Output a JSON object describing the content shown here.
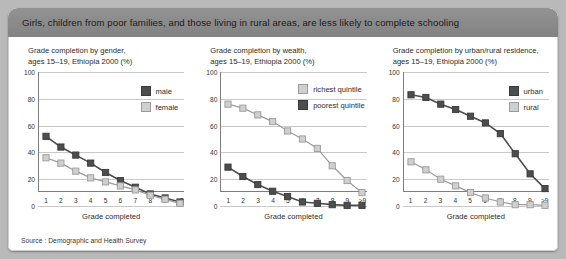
{
  "banner": {
    "headline": "Girls, children from poor families, and those living in rural areas, are less likely to complete schooling"
  },
  "source": {
    "text": "Source : Demographic and Health Survey"
  },
  "axis": {
    "ylabel_ticks": [
      "0",
      "20",
      "40",
      "60",
      "80",
      "100"
    ],
    "xlabel": "Grade completed",
    "xticks": [
      "1",
      "2",
      "3",
      "4",
      "5",
      "6",
      "7",
      "8",
      "9",
      ">9"
    ]
  },
  "colors": {
    "dark": "#4d4d4d",
    "dark_border": "#3a3a3a",
    "light": "#cfcfcf",
    "light_border": "#9b9b9b",
    "grid": "#c9c9c9",
    "axis": "#7d7d7d",
    "banner": "#8a8a8a",
    "page": "#b9b9b9"
  },
  "chart_data": [
    {
      "type": "line",
      "id": "gender",
      "title": "Grade completion by gender,\nages 15–19, Ethiopia 2000 (%)",
      "xlabel": "Grade completed",
      "ylabel": "",
      "categories": [
        "1",
        "2",
        "3",
        "4",
        "5",
        "6",
        "7",
        "8",
        "9",
        ">9"
      ],
      "ylim": [
        0,
        100
      ],
      "yticks": [
        0,
        20,
        40,
        60,
        80,
        100
      ],
      "grid": true,
      "legend_position": "top-right",
      "series": [
        {
          "name": "male",
          "style": "dark",
          "values": [
            52,
            44,
            38,
            32,
            25,
            19,
            14,
            9,
            6,
            3
          ]
        },
        {
          "name": "female",
          "style": "light",
          "values": [
            36,
            32,
            26,
            21,
            18,
            15,
            12,
            8,
            5,
            2
          ]
        }
      ]
    },
    {
      "type": "line",
      "id": "wealth",
      "title": "Grade completion by wealth,\nages 15–19, Ethiopia 2000 (%)",
      "xlabel": "Grade completed",
      "ylabel": "",
      "categories": [
        "1",
        "2",
        "3",
        "4",
        "5",
        "6",
        "7",
        "8",
        "9",
        ">9"
      ],
      "ylim": [
        0,
        100
      ],
      "yticks": [
        0,
        20,
        40,
        60,
        80,
        100
      ],
      "grid": true,
      "legend_position": "top-right",
      "series": [
        {
          "name": "richest quintile",
          "style": "light",
          "values": [
            76,
            73,
            68,
            63,
            56,
            50,
            43,
            30,
            19,
            10
          ]
        },
        {
          "name": "poorest quintile",
          "style": "dark",
          "values": [
            29,
            22,
            16,
            11,
            7,
            3,
            2,
            1,
            0.5,
            0.5
          ]
        }
      ]
    },
    {
      "type": "line",
      "id": "residence",
      "title": "Grade completion by urban/rural residence,\nages 15–19, Ethiopia 2000 (%)",
      "xlabel": "Grade completed",
      "ylabel": "",
      "categories": [
        "1",
        "2",
        "3",
        "4",
        "5",
        "6",
        "7",
        "8",
        "9",
        ">9"
      ],
      "ylim": [
        0,
        100
      ],
      "yticks": [
        0,
        20,
        40,
        60,
        80,
        100
      ],
      "grid": true,
      "legend_position": "top-right",
      "series": [
        {
          "name": "urban",
          "style": "dark",
          "values": [
            83,
            81,
            76,
            72,
            67,
            62,
            54,
            39,
            24,
            13
          ]
        },
        {
          "name": "rural",
          "style": "light",
          "values": [
            33,
            27,
            20,
            15,
            10,
            6,
            3,
            1,
            1,
            0.5
          ]
        }
      ]
    }
  ]
}
